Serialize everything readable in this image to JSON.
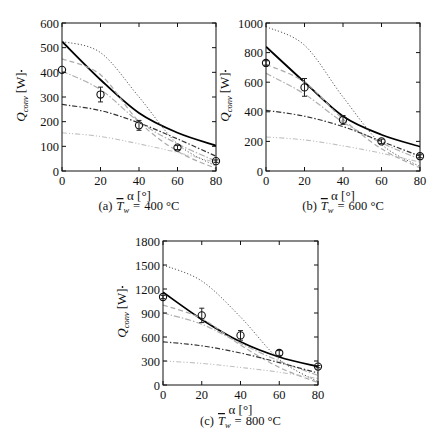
{
  "figure": {
    "subplots_count": 3
  },
  "chart_data": [
    {
      "type": "line",
      "panel": "a",
      "caption": {
        "prefix": "(a)",
        "symbol": "T",
        "subscript": "w",
        "equals": "=",
        "value": "400 °C"
      },
      "xlabel": "α [°]",
      "ylabel": {
        "symbol": "Q",
        "subscript": "conv",
        "unit": "[W]"
      },
      "xlim": [
        0,
        80
      ],
      "ylim": [
        0,
        600
      ],
      "xticks": [
        0,
        20,
        40,
        60,
        80
      ],
      "yticks": [
        0,
        100,
        200,
        300,
        400,
        500,
        600
      ],
      "grid": false,
      "x": [
        0,
        20,
        40,
        60,
        80
      ],
      "series": [
        {
          "name": "model-solid",
          "style": "solid",
          "color": "#000000",
          "values": [
            525,
            370,
            235,
            155,
            103
          ]
        },
        {
          "name": "model-dotted",
          "style": "dotted",
          "color": "#555555",
          "values": [
            525,
            480,
            300,
            110,
            20
          ]
        },
        {
          "name": "model-dashed",
          "style": "dashed",
          "color": "#aaaaaa",
          "values": [
            455,
            390,
            200,
            80,
            10
          ]
        },
        {
          "name": "model-dashdot-light",
          "style": "dashdot-light",
          "color": "#b0b0b0",
          "values": [
            405,
            330,
            200,
            110,
            40
          ]
        },
        {
          "name": "model-dashdot-dark",
          "style": "dashdot",
          "color": "#333333",
          "values": [
            270,
            245,
            195,
            130,
            60
          ]
        },
        {
          "name": "model-dashdotdot",
          "style": "dashdotdot",
          "color": "#c0c0c0",
          "values": [
            155,
            140,
            110,
            75,
            35
          ]
        }
      ],
      "experiment": {
        "name": "measured",
        "x": [
          0,
          20,
          40,
          60,
          80
        ],
        "values": [
          410,
          310,
          185,
          95,
          40
        ],
        "errors": [
          0,
          30,
          20,
          8,
          5
        ]
      }
    },
    {
      "type": "line",
      "panel": "b",
      "caption": {
        "prefix": "(b)",
        "symbol": "T",
        "subscript": "w",
        "equals": "=",
        "value": "600 °C"
      },
      "xlabel": "α [°]",
      "ylabel": {
        "symbol": "Q",
        "subscript": "conv",
        "unit": "[W]"
      },
      "xlim": [
        0,
        80
      ],
      "ylim": [
        0,
        1000
      ],
      "xticks": [
        0,
        20,
        40,
        60,
        80
      ],
      "yticks": [
        0,
        200,
        400,
        600,
        800,
        1000
      ],
      "grid": false,
      "x": [
        0,
        20,
        40,
        60,
        80
      ],
      "series": [
        {
          "name": "model-solid",
          "style": "solid",
          "color": "#000000",
          "values": [
            840,
            600,
            370,
            245,
            165
          ]
        },
        {
          "name": "model-dotted",
          "style": "dotted",
          "color": "#555555",
          "values": [
            975,
            850,
            500,
            180,
            30
          ]
        },
        {
          "name": "model-dashed",
          "style": "dashed",
          "color": "#aaaaaa",
          "values": [
            720,
            600,
            350,
            150,
            20
          ]
        },
        {
          "name": "model-dashdot-light",
          "style": "dashdot-light",
          "color": "#b0b0b0",
          "values": [
            660,
            520,
            330,
            190,
            80
          ]
        },
        {
          "name": "model-dashdot-dark",
          "style": "dashdot",
          "color": "#333333",
          "values": [
            410,
            370,
            300,
            200,
            100
          ]
        },
        {
          "name": "model-dashdotdot",
          "style": "dashdotdot",
          "color": "#c0c0c0",
          "values": [
            230,
            210,
            170,
            120,
            60
          ]
        }
      ],
      "experiment": {
        "name": "measured",
        "x": [
          0,
          20,
          40,
          60,
          80
        ],
        "values": [
          730,
          565,
          345,
          200,
          100
        ],
        "errors": [
          15,
          60,
          30,
          15,
          10
        ]
      }
    },
    {
      "type": "line",
      "panel": "c",
      "caption": {
        "prefix": "(c)",
        "symbol": "T",
        "subscript": "w",
        "equals": "=",
        "value": "800 °C"
      },
      "xlabel": "α [°]",
      "ylabel": {
        "symbol": "Q",
        "subscript": "conv",
        "unit": "[W]"
      },
      "xlim": [
        0,
        80
      ],
      "ylim": [
        0,
        1800
      ],
      "xticks": [
        0,
        20,
        40,
        60,
        80
      ],
      "yticks": [
        0,
        300,
        600,
        900,
        1200,
        1500,
        1800
      ],
      "grid": false,
      "x": [
        0,
        20,
        40,
        60,
        80
      ],
      "series": [
        {
          "name": "model-solid",
          "style": "solid",
          "color": "#000000",
          "values": [
            1160,
            820,
            540,
            350,
            230
          ]
        },
        {
          "name": "model-dotted",
          "style": "dotted",
          "color": "#555555",
          "values": [
            1500,
            1300,
            850,
            320,
            40
          ]
        },
        {
          "name": "model-dashed",
          "style": "dashed",
          "color": "#aaaaaa",
          "values": [
            1000,
            830,
            500,
            220,
            30
          ]
        },
        {
          "name": "model-dashdot-light",
          "style": "dashdot-light",
          "color": "#b0b0b0",
          "values": [
            900,
            760,
            520,
            300,
            120
          ]
        },
        {
          "name": "model-dashdot-dark",
          "style": "dashdot",
          "color": "#333333",
          "values": [
            540,
            490,
            400,
            280,
            150
          ]
        },
        {
          "name": "model-dashdotdot",
          "style": "dashdotdot",
          "color": "#c0c0c0",
          "values": [
            300,
            270,
            220,
            160,
            80
          ]
        }
      ],
      "experiment": {
        "name": "measured",
        "x": [
          0,
          20,
          40,
          60,
          80
        ],
        "values": [
          1100,
          870,
          620,
          400,
          230
        ],
        "errors": [
          20,
          90,
          60,
          30,
          15
        ]
      }
    }
  ]
}
